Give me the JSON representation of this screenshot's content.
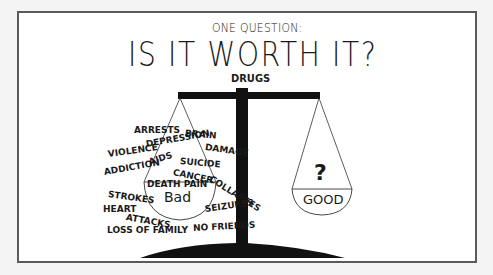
{
  "header": {
    "subtitle": "ONE QUESTION:",
    "title": "IS IT WORTH IT?"
  },
  "scale": {
    "beam_label": "DRUGS",
    "left_pan": {
      "label": "Bad",
      "words": [
        {
          "text": "ARRESTS",
          "x": 134,
          "y": 126,
          "rot": 0
        },
        {
          "text": "BRAIN",
          "x": 185,
          "y": 129,
          "rot": 5
        },
        {
          "text": "DAMAGE",
          "x": 205,
          "y": 143,
          "rot": 8
        },
        {
          "text": "VIOLENCE",
          "x": 108,
          "y": 150,
          "rot": -8
        },
        {
          "text": "DEPRESSION",
          "x": 146,
          "y": 140,
          "rot": -10
        },
        {
          "text": "ADDICTION",
          "x": 104,
          "y": 168,
          "rot": -10
        },
        {
          "text": "AIDS",
          "x": 149,
          "y": 158,
          "rot": -18
        },
        {
          "text": "SUICIDE",
          "x": 180,
          "y": 157,
          "rot": 5
        },
        {
          "text": "CANCER",
          "x": 173,
          "y": 168,
          "rot": 12
        },
        {
          "text": "COLLAPSES",
          "x": 210,
          "y": 174,
          "rot": 32
        },
        {
          "text": "DEATH PAIN",
          "x": 147,
          "y": 180,
          "rot": 0
        },
        {
          "text": "STROKES",
          "x": 108,
          "y": 190,
          "rot": 8
        },
        {
          "text": "HEART",
          "x": 103,
          "y": 205,
          "rot": 0
        },
        {
          "text": "ATTACKS",
          "x": 126,
          "y": 213,
          "rot": 10
        },
        {
          "text": "SEIZURES",
          "x": 205,
          "y": 205,
          "rot": -8
        },
        {
          "text": "LOSS OF FAMILY",
          "x": 107,
          "y": 226,
          "rot": 0
        },
        {
          "text": "NO FRIENDS",
          "x": 193,
          "y": 224,
          "rot": -3
        }
      ]
    },
    "right_pan": {
      "label": "GOOD",
      "symbol": "?"
    }
  },
  "colors": {
    "ink": "#1a1a1a",
    "panel_bg": "#ffffff",
    "page_bg": "#f4f4f4",
    "frame": "#5a5a5a"
  }
}
